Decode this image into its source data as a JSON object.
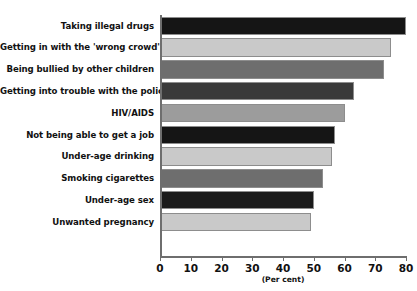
{
  "chart_data": {
    "type": "bar",
    "orientation": "horizontal",
    "title": "",
    "xlabel": "(Per cent)",
    "ylabel": "",
    "xlim": [
      0,
      80
    ],
    "xticks": [
      0,
      10,
      20,
      30,
      40,
      50,
      60,
      70,
      80
    ],
    "grid": false,
    "legend": "none",
    "categories": [
      "Taking illegal drugs",
      "Getting in with the 'wrong crowd'",
      "Being bullied by other children",
      "Getting into trouble with the police",
      "HIV/AIDS",
      "Not being able to get a job",
      "Under-age drinking",
      "Smoking cigarettes",
      "Under-age sex",
      "Unwanted pregnancy"
    ],
    "values": [
      80,
      75,
      73,
      63,
      60,
      57,
      56,
      53,
      50,
      49
    ],
    "bar_colors": [
      "#151515",
      "#c9c9c9",
      "#6e6e6e",
      "#3a3a3a",
      "#9c9c9c",
      "#151515",
      "#c9c9c9",
      "#6e6e6e",
      "#1a1a1a",
      "#c9c9c9"
    ]
  },
  "axis": {
    "unit_label": "(Per cent)",
    "tick_labels": [
      "0",
      "10",
      "20",
      "30",
      "40",
      "50",
      "60",
      "70",
      "80"
    ]
  },
  "footer": {
    "source": ""
  }
}
